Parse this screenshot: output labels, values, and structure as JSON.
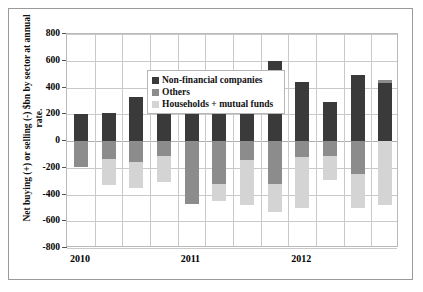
{
  "chart_data": {
    "type": "bar",
    "stacked": true,
    "title": "",
    "xlabel": "",
    "ylabel": "Net buying (+) or selling (-) $bn by sector at annual rate.",
    "ylim": [
      -800,
      800
    ],
    "yticks": [
      800,
      600,
      400,
      200,
      0,
      -200,
      -400,
      -600,
      -800
    ],
    "ytick_labels": [
      "800",
      "600",
      "400",
      "200",
      "0",
      "-200",
      "-400",
      "-600",
      "-800"
    ],
    "grid": true,
    "legend_position": "top-left",
    "x_axis_labels": [
      "2010",
      "2011",
      "2012"
    ],
    "categories": [
      "2010 Q1",
      "2010 Q2",
      "2010 Q3",
      "2010 Q4",
      "2011 Q1",
      "2011 Q2",
      "2011 Q3",
      "2011 Q4",
      "2012 Q1",
      "2012 Q2",
      "2012 Q3",
      "2012 Q4"
    ],
    "series": [
      {
        "name": "Non-financial companies",
        "color": "#3a3a3a",
        "values": [
          200,
          210,
          330,
          355,
          315,
          400,
          500,
          600,
          440,
          290,
          490,
          430
        ]
      },
      {
        "name": "Others",
        "color": "#8c8c8c",
        "values": [
          -195,
          -135,
          -155,
          -110,
          -470,
          -320,
          -140,
          -325,
          -120,
          -115,
          -250,
          25
        ]
      },
      {
        "name": "Households + mutual funds",
        "color": "#d4d4d4",
        "values": [
          0,
          -195,
          -200,
          -200,
          70,
          -130,
          -335,
          -205,
          -380,
          -175,
          -250,
          -480
        ]
      }
    ]
  },
  "legend": {
    "items": [
      {
        "label": "Non-financial companies",
        "color": "#3a3a3a"
      },
      {
        "label": "Others",
        "color": "#8c8c8c"
      },
      {
        "label": "Households + mutual funds",
        "color": "#d4d4d4"
      }
    ]
  }
}
